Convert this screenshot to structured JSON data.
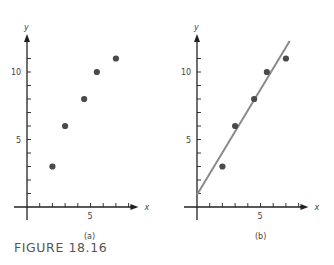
{
  "figure": {
    "caption": "FIGURE 18.16"
  },
  "chart_data": [
    {
      "type": "scatter",
      "panel_label": "(a)",
      "xlabel": "x",
      "ylabel": "y",
      "x_tick_labels": [
        "5"
      ],
      "y_tick_labels": [
        "5",
        "10"
      ],
      "xlim": [
        0,
        8
      ],
      "ylim": [
        0,
        12
      ],
      "grid": false,
      "points": [
        {
          "x": 2,
          "y": 3
        },
        {
          "x": 3,
          "y": 6
        },
        {
          "x": 4.5,
          "y": 8
        },
        {
          "x": 5.5,
          "y": 10
        },
        {
          "x": 7,
          "y": 11
        }
      ]
    },
    {
      "type": "scatter",
      "panel_label": "(b)",
      "xlabel": "x",
      "ylabel": "y",
      "x_tick_labels": [
        "5"
      ],
      "y_tick_labels": [
        "5",
        "10"
      ],
      "xlim": [
        0,
        8
      ],
      "ylim": [
        0,
        12
      ],
      "grid": false,
      "points": [
        {
          "x": 2,
          "y": 3
        },
        {
          "x": 3,
          "y": 6
        },
        {
          "x": 4.5,
          "y": 8
        },
        {
          "x": 5.5,
          "y": 10
        },
        {
          "x": 7,
          "y": 11
        }
      ],
      "fit_line": {
        "x0": 0,
        "y0": 0.9,
        "x1": 7.3,
        "y1": 12.3,
        "color": "#8a8a8a"
      }
    }
  ],
  "colors": {
    "axis": "#222222",
    "point": "#4a4a4a",
    "fit_line": "#8a8a8a"
  }
}
